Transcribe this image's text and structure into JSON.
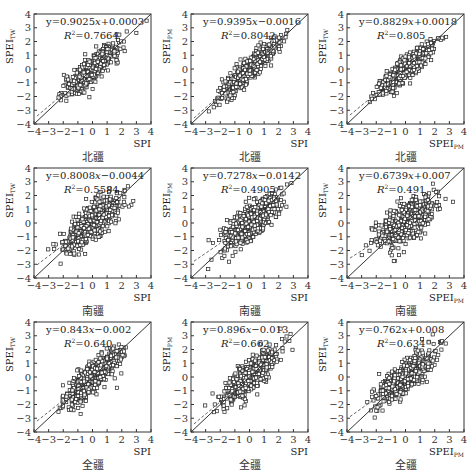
{
  "chart_data": [
    {
      "type": "scatter",
      "row": 0,
      "col": 0,
      "xlabel": "SPI",
      "xlabel_sub": "",
      "ylabel": "SPEI",
      "ylabel_sub": "TW",
      "region": "北疆",
      "equation": "y=0.9025x+0.0003",
      "slope": 0.9025,
      "intercept": 0.0003,
      "r2_label": "R²=0.7664",
      "r2": 0.7664,
      "xlim": [
        -4,
        4
      ],
      "ylim": [
        -4,
        4
      ],
      "xticks": [
        -4,
        -3,
        -2,
        -1,
        0,
        1,
        2,
        3,
        4
      ],
      "yticks": [
        -4,
        -3,
        -2,
        -1,
        0,
        1,
        2,
        3,
        4
      ],
      "reference_line": "1:1",
      "marker": "hollow-square"
    },
    {
      "type": "scatter",
      "row": 0,
      "col": 1,
      "xlabel": "SPI",
      "xlabel_sub": "",
      "ylabel": "SPEI",
      "ylabel_sub": "PM",
      "region": "北疆",
      "equation": "y=0.9395x−0.0016",
      "slope": 0.9395,
      "intercept": -0.0016,
      "r2_label": "R²=0.8042",
      "r2": 0.8042,
      "xlim": [
        -4,
        4
      ],
      "ylim": [
        -4,
        4
      ],
      "xticks": [
        -4,
        -3,
        -2,
        -1,
        0,
        1,
        2,
        3,
        4
      ],
      "yticks": [
        -4,
        -3,
        -2,
        -1,
        0,
        1,
        2,
        3,
        4
      ],
      "reference_line": "1:1",
      "marker": "hollow-square"
    },
    {
      "type": "scatter",
      "row": 0,
      "col": 2,
      "xlabel": "SPEI",
      "xlabel_sub": "PM",
      "ylabel": "SPEI",
      "ylabel_sub": "TW",
      "region": "北疆",
      "equation": "y=0.8829x+0.0018",
      "slope": 0.8829,
      "intercept": 0.0018,
      "r2_label": "R²=0.805",
      "r2": 0.805,
      "xlim": [
        -4,
        4
      ],
      "ylim": [
        -4,
        4
      ],
      "xticks": [
        -4,
        -3,
        -2,
        -1,
        0,
        1,
        2,
        3,
        4
      ],
      "yticks": [
        -4,
        -3,
        -2,
        -1,
        0,
        1,
        2,
        3,
        4
      ],
      "reference_line": "1:1",
      "marker": "hollow-square"
    },
    {
      "type": "scatter",
      "row": 1,
      "col": 0,
      "xlabel": "SPI",
      "xlabel_sub": "",
      "ylabel": "SPEI",
      "ylabel_sub": "TW",
      "region": "南疆",
      "equation": "y=0.8008x−0.0044",
      "slope": 0.8008,
      "intercept": -0.0044,
      "r2_label": "R²=0.5584",
      "r2": 0.5584,
      "xlim": [
        -4,
        4
      ],
      "ylim": [
        -4,
        4
      ],
      "xticks": [
        -4,
        -3,
        -2,
        -1,
        0,
        1,
        2,
        3,
        4
      ],
      "yticks": [
        -4,
        -3,
        -2,
        -1,
        0,
        1,
        2,
        3,
        4
      ],
      "reference_line": "1:1",
      "marker": "hollow-square"
    },
    {
      "type": "scatter",
      "row": 1,
      "col": 1,
      "xlabel": "SPI",
      "xlabel_sub": "",
      "ylabel": "SPEI",
      "ylabel_sub": "PM",
      "region": "南疆",
      "equation": "y=0.7278x−0.0142",
      "slope": 0.7278,
      "intercept": -0.0142,
      "r2_label": "R²=0.4905",
      "r2": 0.4905,
      "xlim": [
        -4,
        4
      ],
      "ylim": [
        -4,
        4
      ],
      "xticks": [
        -4,
        -3,
        -2,
        -1,
        0,
        1,
        2,
        3,
        4
      ],
      "yticks": [
        -4,
        -3,
        -2,
        -1,
        0,
        1,
        2,
        3,
        4
      ],
      "reference_line": "1:1",
      "marker": "hollow-square"
    },
    {
      "type": "scatter",
      "row": 1,
      "col": 2,
      "xlabel": "SPEI",
      "xlabel_sub": "PM",
      "ylabel": "SPEI",
      "ylabel_sub": "TW",
      "region": "南疆",
      "equation": "y=0.6739x+0.007",
      "slope": 0.6739,
      "intercept": 0.007,
      "r2_label": "R²=0.491",
      "r2": 0.491,
      "xlim": [
        -4,
        4
      ],
      "ylim": [
        -4,
        4
      ],
      "xticks": [
        -4,
        -3,
        -2,
        -1,
        0,
        1,
        2,
        3,
        4
      ],
      "yticks": [
        -4,
        -3,
        -2,
        -1,
        0,
        1,
        2,
        3,
        4
      ],
      "reference_line": "1:1",
      "marker": "hollow-square"
    },
    {
      "type": "scatter",
      "row": 2,
      "col": 0,
      "xlabel": "SPI",
      "xlabel_sub": "",
      "ylabel": "SPEI",
      "ylabel_sub": "TW",
      "region": "全疆",
      "equation": "y=0.843x−0.002",
      "slope": 0.843,
      "intercept": -0.002,
      "r2_label": "R²=0.640",
      "r2": 0.64,
      "xlim": [
        -4,
        4
      ],
      "ylim": [
        -4,
        4
      ],
      "xticks": [
        -4,
        -3,
        -2,
        -1,
        0,
        1,
        2,
        3,
        4
      ],
      "yticks": [
        -4,
        -3,
        -2,
        -1,
        0,
        1,
        2,
        3,
        4
      ],
      "reference_line": "1:1",
      "marker": "hollow-square"
    },
    {
      "type": "scatter",
      "row": 2,
      "col": 1,
      "xlabel": "SPI",
      "xlabel_sub": "",
      "ylabel": "SPEI",
      "ylabel_sub": "PM",
      "region": "全疆",
      "equation": "y=0.896x−0.013",
      "slope": 0.896,
      "intercept": -0.013,
      "r2_label": "R²=0.662",
      "r2": 0.662,
      "xlim": [
        -4,
        4
      ],
      "ylim": [
        -4,
        4
      ],
      "xticks": [
        -4,
        -3,
        -2,
        -1,
        0,
        1,
        2,
        3,
        4
      ],
      "yticks": [
        -4,
        -3,
        -2,
        -1,
        0,
        1,
        2,
        3,
        4
      ],
      "reference_line": "1:1",
      "marker": "hollow-square"
    },
    {
      "type": "scatter",
      "row": 2,
      "col": 2,
      "xlabel": "SPEI",
      "xlabel_sub": "PM",
      "ylabel": "SPEI",
      "ylabel_sub": "TW",
      "region": "全疆",
      "equation": "y=0.762x+0.008",
      "slope": 0.762,
      "intercept": 0.008,
      "r2_label": "R²=0.634",
      "r2": 0.634,
      "xlim": [
        -4,
        4
      ],
      "ylim": [
        -4,
        4
      ],
      "xticks": [
        -4,
        -3,
        -2,
        -1,
        0,
        1,
        2,
        3,
        4
      ],
      "yticks": [
        -4,
        -3,
        -2,
        -1,
        0,
        1,
        2,
        3,
        4
      ],
      "reference_line": "1:1",
      "marker": "hollow-square"
    }
  ],
  "panels": [
    {
      "eq_prefix": "y=0.9025",
      "eq_suffix": "+0.0003",
      "r2": "=0.7664",
      "ylabel": "SPEI",
      "ysub": "TW",
      "xlabel": "SPI",
      "xsub": "",
      "region": "北疆"
    },
    {
      "eq_prefix": "y=0.9395",
      "eq_suffix": "−0.0016",
      "r2": "=0.8042",
      "ylabel": "SPEI",
      "ysub": "PM",
      "xlabel": "SPI",
      "xsub": "",
      "region": "北疆"
    },
    {
      "eq_prefix": "y=0.8829",
      "eq_suffix": "+0.0018",
      "r2": "=0.805",
      "ylabel": "SPEI",
      "ysub": "TW",
      "xlabel": "SPEI",
      "xsub": "PM",
      "region": "北疆"
    },
    {
      "eq_prefix": "y=0.8008",
      "eq_suffix": "−0.0044",
      "r2": "=0.5584",
      "ylabel": "SPEI",
      "ysub": "TW",
      "xlabel": "SPI",
      "xsub": "",
      "region": "南疆"
    },
    {
      "eq_prefix": "y=0.7278",
      "eq_suffix": "−0.0142",
      "r2": "=0.4905",
      "ylabel": "SPEI",
      "ysub": "PM",
      "xlabel": "SPI",
      "xsub": "",
      "region": "南疆"
    },
    {
      "eq_prefix": "y=0.6739",
      "eq_suffix": "+0.007",
      "r2": "=0.491",
      "ylabel": "SPEI",
      "ysub": "TW",
      "xlabel": "SPEI",
      "xsub": "PM",
      "region": "南疆"
    },
    {
      "eq_prefix": "y=0.843",
      "eq_suffix": "−0.002",
      "r2": "=0.640",
      "ylabel": "SPEI",
      "ysub": "TW",
      "xlabel": "SPI",
      "xsub": "",
      "region": "全疆"
    },
    {
      "eq_prefix": "y=0.896",
      "eq_suffix": "−0.013",
      "r2": "=0.662",
      "ylabel": "SPEI",
      "ysub": "PM",
      "xlabel": "SPI",
      "xsub": "",
      "region": "全疆"
    },
    {
      "eq_prefix": "y=0.762",
      "eq_suffix": "+0.008",
      "r2": "=0.634",
      "ylabel": "SPEI",
      "ysub": "TW",
      "xlabel": "SPEI",
      "xsub": "PM",
      "region": "全疆"
    }
  ],
  "ticks": [
    "-4",
    "-3",
    "-2",
    "-1",
    "0",
    "1",
    "2",
    "3",
    "4"
  ],
  "tick_labels": [
    "−4",
    "−3",
    "−2",
    "−1",
    "0",
    "1",
    "2",
    "3",
    "4"
  ],
  "colors": {
    "axis": "#333333",
    "marker": "#222222",
    "line": "#333333",
    "background": "#ffffff"
  }
}
